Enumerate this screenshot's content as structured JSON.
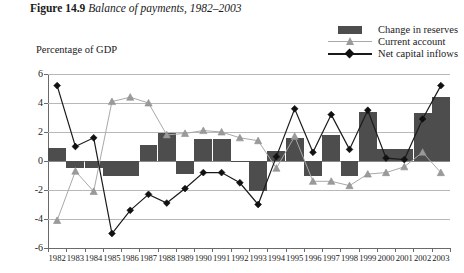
{
  "figure": {
    "number_label": "Figure 14.9",
    "title": "Balance of payments, 1982–2003",
    "axis_title": "Percentage of GDP"
  },
  "legend": {
    "position": "top-right",
    "items": [
      {
        "label": "Change in reserves",
        "key": "bar-swatch",
        "color": "#4d4d4d"
      },
      {
        "label": "Current account",
        "key": "line-triangle-marker",
        "color": "#a9a9a9"
      },
      {
        "label": "Net capital inflows",
        "key": "line-diamond-marker",
        "color": "#1a1a1a"
      }
    ]
  },
  "chart_data": {
    "type": "bar",
    "title": "Balance of payments, 1982–2003",
    "xlabel": "",
    "ylabel": "Percentage of GDP",
    "ylim": [
      -6,
      6
    ],
    "yticks": [
      6,
      4,
      2,
      0,
      -2,
      -4,
      -6
    ],
    "grid": true,
    "legend_position": "top-right",
    "categories": [
      "1982",
      "1983",
      "1984",
      "1985",
      "1986",
      "1987",
      "1988",
      "1989",
      "1990",
      "1991",
      "1992",
      "1993",
      "1994",
      "1995",
      "1996",
      "1997",
      "1998",
      "1999",
      "2000",
      "2001",
      "2002",
      "2003"
    ],
    "series": [
      {
        "name": "Change in reserves",
        "type": "bar",
        "color": "#4d4d4d",
        "values": [
          0.9,
          -0.5,
          -0.5,
          -1.0,
          -1.0,
          1.1,
          1.9,
          -0.9,
          1.5,
          1.5,
          -0.1,
          -2.1,
          0.7,
          1.6,
          -1.0,
          1.8,
          -1.0,
          3.4,
          0.8,
          0.8,
          3.3,
          4.4
        ]
      },
      {
        "name": "Current account",
        "type": "line",
        "marker": "triangle",
        "color": "#a9a9a9",
        "values": [
          -4.1,
          -0.7,
          -2.1,
          4.1,
          4.4,
          4.0,
          1.8,
          1.9,
          2.1,
          2.0,
          1.6,
          1.4,
          -0.5,
          1.7,
          -1.4,
          -1.4,
          -1.7,
          -0.9,
          -0.8,
          -0.4,
          0.6,
          -0.8
        ]
      },
      {
        "name": "Net capital inflows",
        "type": "line",
        "marker": "diamond",
        "color": "#1a1a1a",
        "values": [
          5.2,
          1.0,
          1.6,
          -5.0,
          -3.4,
          -2.3,
          -2.9,
          -1.9,
          -0.8,
          -0.8,
          -1.5,
          -3.0,
          0.3,
          3.6,
          0.6,
          3.2,
          0.8,
          3.5,
          0.2,
          0.1,
          2.9,
          5.2
        ]
      }
    ]
  }
}
